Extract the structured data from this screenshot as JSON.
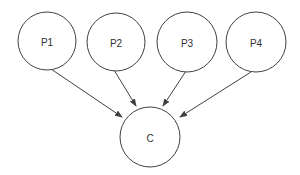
{
  "diagram": {
    "type": "directed-graph",
    "nodes": [
      {
        "id": "P1",
        "label": "P1"
      },
      {
        "id": "P2",
        "label": "P2"
      },
      {
        "id": "P3",
        "label": "P3"
      },
      {
        "id": "P4",
        "label": "P4"
      },
      {
        "id": "C",
        "label": "C"
      }
    ],
    "edges": [
      {
        "from": "P1",
        "to": "C"
      },
      {
        "from": "P2",
        "to": "C"
      },
      {
        "from": "P3",
        "to": "C"
      },
      {
        "from": "P4",
        "to": "C"
      }
    ],
    "colors": {
      "stroke": "#404040",
      "text": "#303030",
      "background": "#ffffff"
    }
  }
}
